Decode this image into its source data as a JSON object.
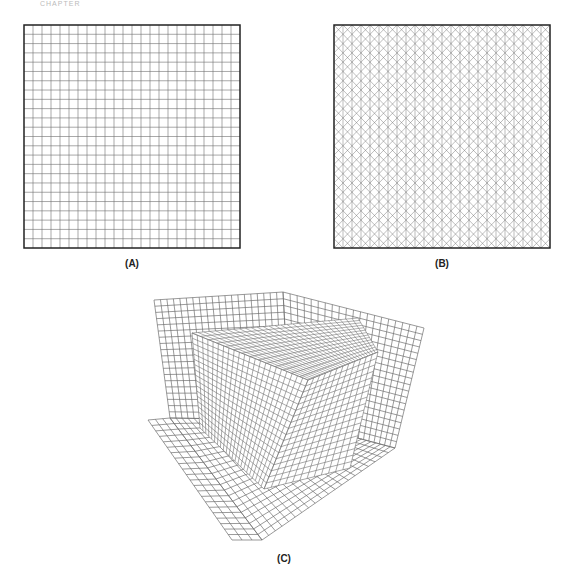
{
  "header": {
    "text": "CHAPTER"
  },
  "panels": [
    {
      "id": "A",
      "label": "(A)",
      "type": "structured-quad-grid",
      "cells": 24
    },
    {
      "id": "B",
      "label": "(B)",
      "type": "triangular-grid",
      "cells": 24
    },
    {
      "id": "C",
      "label": "(C)",
      "type": "3d-hexahedral-mesh-box-in-corner"
    }
  ],
  "colors": {
    "mesh": "#6e6e6e",
    "frame": "#222222",
    "background": "#ffffff"
  }
}
